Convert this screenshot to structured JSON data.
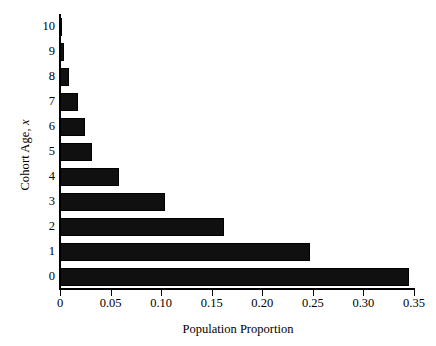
{
  "chart_data": {
    "type": "bar",
    "orientation": "horizontal",
    "title": "",
    "xlabel": "Population Proportion",
    "ylabel": "Cohort Age, x",
    "ylabel_plain": "Cohort Age,",
    "ylabel_italic": "x",
    "categories": [
      "0",
      "1",
      "2",
      "3",
      "4",
      "5",
      "6",
      "7",
      "8",
      "9",
      "10"
    ],
    "values": [
      0.345,
      0.247,
      0.162,
      0.104,
      0.058,
      0.032,
      0.025,
      0.018,
      0.009,
      0.004,
      0.002
    ],
    "xlim": [
      0,
      0.35
    ],
    "xticks": [
      0,
      0.05,
      0.1,
      0.15,
      0.2,
      0.25,
      0.3,
      0.35
    ],
    "xtick_labels": [
      "0",
      "0.05",
      "0.10",
      "0.15",
      "0.20",
      "0.25",
      "0.30",
      "0.35"
    ],
    "ytick_labels": [
      "0",
      "1",
      "2",
      "3",
      "4",
      "5",
      "6",
      "7",
      "8",
      "9",
      "10"
    ],
    "grid": false,
    "legend": null,
    "bar_color": "#101010",
    "background_color": "#ffffff"
  }
}
